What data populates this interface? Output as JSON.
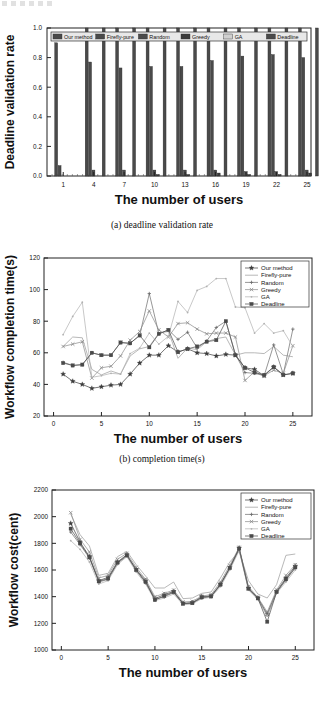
{
  "figure": {
    "captions": {
      "a": "(a) deadline validation rate",
      "b": "(b) completion time(s)"
    }
  },
  "series_names": [
    "Our method",
    "Firefly-pure",
    "Random",
    "Greedy",
    "GA",
    "Deadline"
  ],
  "chart_data": [
    {
      "type": "bar",
      "title": "",
      "xlabel": "The number of users",
      "ylabel": "Deadline validation rate",
      "xlim": [
        0,
        26
      ],
      "ylim": [
        0.0,
        1.0
      ],
      "yticks": [
        "0.0",
        "0.2",
        "0.4",
        "0.6",
        "0.8",
        "1.0"
      ],
      "xticks": [
        "1",
        "4",
        "7",
        "10",
        "13",
        "16",
        "19",
        "22",
        "25"
      ],
      "grid": false,
      "legend_position": "top-inside",
      "legend": [
        "Our method",
        "Firefly-pure",
        "Random",
        "Greedy",
        "GA",
        "Deadline"
      ],
      "categories": [
        "1",
        "4",
        "7",
        "10",
        "13",
        "16",
        "19",
        "22",
        "25"
      ],
      "series": [
        {
          "name": "Our method",
          "values": [
            0.9,
            1.0,
            1.0,
            1.0,
            1.0,
            1.0,
            1.0,
            1.0,
            1.0
          ]
        },
        {
          "name": "Firefly-pure",
          "values": [
            0.07,
            0.77,
            0.73,
            0.74,
            0.74,
            0.78,
            0.81,
            0.82,
            0.8
          ]
        },
        {
          "name": "Random",
          "values": [
            0.0,
            0.04,
            0.04,
            0.04,
            0.04,
            0.04,
            0.03,
            0.03,
            0.04
          ]
        },
        {
          "name": "Greedy",
          "values": [
            0.0,
            0.0,
            0.0,
            0.01,
            0.01,
            0.02,
            0.01,
            0.01,
            0.02
          ]
        },
        {
          "name": "GA",
          "values": [
            0.0,
            0.0,
            0.0,
            0.0,
            0.0,
            0.0,
            0.0,
            0.0,
            0.0
          ]
        },
        {
          "name": "Deadline",
          "values": [
            0.0,
            1.0,
            1.0,
            1.0,
            1.0,
            1.0,
            1.0,
            1.0,
            1.0
          ]
        }
      ]
    },
    {
      "type": "line",
      "title": "",
      "xlabel": "The number of users",
      "ylabel": "Workflow completion time(s)",
      "xlim": [
        -1,
        27
      ],
      "ylim": [
        20,
        120
      ],
      "yticks": [
        "20",
        "40",
        "60",
        "80",
        "100",
        "120"
      ],
      "xticks": [
        "0",
        "5",
        "10",
        "15",
        "20",
        "25"
      ],
      "grid": false,
      "legend_position": "top-right",
      "x": [
        1,
        2,
        3,
        4,
        5,
        6,
        7,
        8,
        9,
        10,
        11,
        12,
        13,
        14,
        15,
        16,
        17,
        18,
        19,
        20,
        21,
        22,
        23,
        24,
        25
      ],
      "series": [
        {
          "name": "Our method",
          "marker": "star",
          "values": [
            46.5,
            42,
            40,
            37.5,
            38.5,
            39.5,
            40,
            46.5,
            53.5,
            58.5,
            58.5,
            64.5,
            60.5,
            62.5,
            60,
            59.5,
            58,
            59,
            58.5,
            50.5,
            49.5,
            45.5,
            51,
            46,
            47
          ]
        },
        {
          "name": "Firefly-pure",
          "marker": "none",
          "values": [
            64,
            70,
            69.5,
            49.5,
            46,
            48.5,
            46.5,
            58,
            62.5,
            64,
            72.5,
            73.5,
            56.5,
            63,
            62,
            67,
            69,
            70,
            58.5,
            60,
            60,
            59.5,
            64,
            58.5,
            57.5
          ]
        },
        {
          "name": "Random",
          "marker": "plus",
          "values": [
            54,
            52,
            52.5,
            60,
            58.5,
            58.5,
            66.5,
            66,
            71,
            97.5,
            72,
            74.5,
            68.5,
            73,
            63,
            67.5,
            76,
            80,
            59,
            47.5,
            47,
            45.5,
            65,
            46.5,
            75
          ]
        },
        {
          "name": "Greedy",
          "marker": "cross",
          "values": [
            64,
            65.5,
            67,
            44,
            50.5,
            51.5,
            58,
            68,
            73.5,
            86.5,
            74.5,
            70,
            78.5,
            79,
            75,
            72,
            72.5,
            72.5,
            70,
            42.5,
            48,
            45.5,
            49,
            47,
            64.5
          ]
        },
        {
          "name": "GA",
          "marker": "dot",
          "values": [
            71.5,
            83,
            92,
            44.5,
            45.5,
            47,
            46.5,
            59.5,
            63,
            72.5,
            65.5,
            70.5,
            92.5,
            85.5,
            99.5,
            102,
            107,
            107,
            89,
            88.5,
            72.5,
            78.5,
            72.5,
            74,
            64
          ]
        },
        {
          "name": "Deadline",
          "marker": "square",
          "values": [
            53.5,
            52,
            52.5,
            60,
            58.5,
            58.5,
            66.5,
            66,
            71,
            63.5,
            72,
            74.5,
            60.5,
            62.5,
            64,
            67,
            68,
            80,
            58.5,
            50.5,
            47.5,
            46,
            51,
            46,
            47
          ]
        }
      ]
    },
    {
      "type": "line",
      "title": "",
      "xlabel": "The number of users",
      "ylabel": "Workflow cost(cent)",
      "xlim": [
        -1,
        27
      ],
      "ylim": [
        1000,
        2200
      ],
      "yticks": [
        "1000",
        "1200",
        "1400",
        "1600",
        "1800",
        "2000",
        "2200"
      ],
      "xticks": [
        "0",
        "5",
        "10",
        "15",
        "20",
        "25"
      ],
      "grid": false,
      "legend_position": "top-right",
      "x": [
        1,
        2,
        3,
        4,
        5,
        6,
        7,
        8,
        9,
        10,
        11,
        12,
        13,
        14,
        15,
        16,
        17,
        18,
        19,
        20,
        21,
        22,
        23,
        24,
        25
      ],
      "series": [
        {
          "name": "Our method",
          "marker": "star",
          "values": [
            1950,
            1810,
            1700,
            1520,
            1545,
            1660,
            1715,
            1605,
            1520,
            1385,
            1415,
            1440,
            1350,
            1355,
            1400,
            1405,
            1495,
            1620,
            1765,
            1465,
            1390,
            1270,
            1440,
            1540,
            1630
          ]
        },
        {
          "name": "Firefly-pure",
          "marker": "none",
          "values": [
            2020,
            1865,
            1780,
            1560,
            1575,
            1700,
            1740,
            1640,
            1555,
            1465,
            1465,
            1510,
            1385,
            1390,
            1425,
            1435,
            1540,
            1660,
            1740,
            1520,
            1420,
            1390,
            1490,
            1710,
            1720
          ]
        },
        {
          "name": "Random",
          "marker": "plus",
          "values": [
            1885,
            1790,
            1690,
            1510,
            1530,
            1650,
            1705,
            1595,
            1505,
            1380,
            1400,
            1430,
            1345,
            1350,
            1390,
            1400,
            1485,
            1610,
            1755,
            1455,
            1385,
            1260,
            1430,
            1525,
            1615
          ]
        },
        {
          "name": "Greedy",
          "marker": "cross",
          "values": [
            2030,
            1830,
            1735,
            1540,
            1560,
            1680,
            1725,
            1620,
            1530,
            1400,
            1425,
            1450,
            1360,
            1365,
            1405,
            1415,
            1510,
            1635,
            1770,
            1475,
            1395,
            1285,
            1450,
            1560,
            1640
          ]
        },
        {
          "name": "GA",
          "marker": "dot",
          "values": [
            1820,
            1755,
            1660,
            1495,
            1520,
            1640,
            1700,
            1585,
            1495,
            1370,
            1390,
            1420,
            1340,
            1345,
            1385,
            1395,
            1475,
            1600,
            1745,
            1450,
            1380,
            1255,
            1425,
            1510,
            1600
          ]
        },
        {
          "name": "Deadline",
          "marker": "square",
          "values": [
            1910,
            1800,
            1695,
            1515,
            1535,
            1655,
            1710,
            1600,
            1510,
            1375,
            1405,
            1435,
            1348,
            1352,
            1395,
            1402,
            1490,
            1615,
            1760,
            1460,
            1388,
            1212,
            1435,
            1530,
            1620
          ]
        }
      ]
    }
  ]
}
